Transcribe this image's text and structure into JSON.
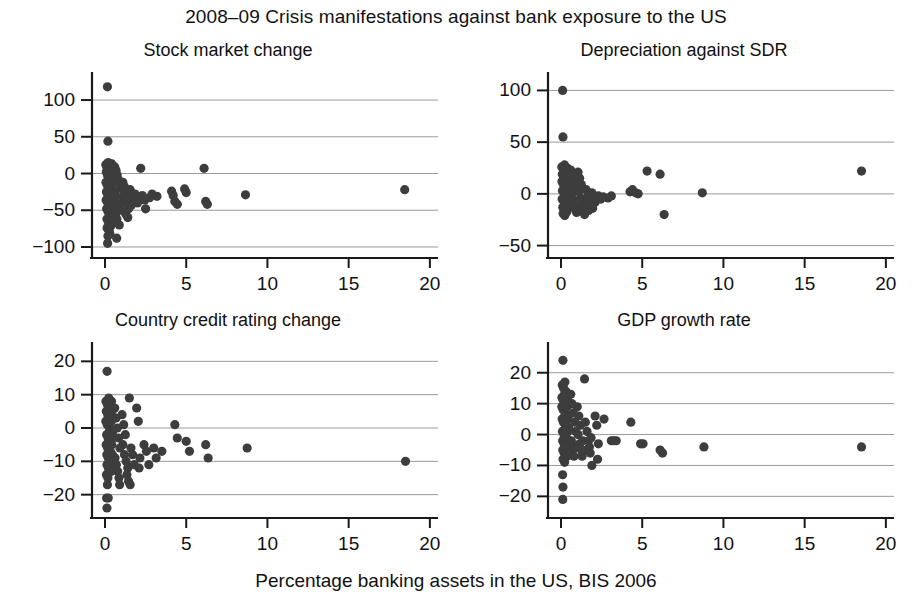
{
  "figure": {
    "title": "2008–09 Crisis manifestations against bank exposure to the US",
    "xlabel": "Percentage banking assets in the US, BIS 2006",
    "marker_color": "#3d3d3d",
    "gridline_color": "#9a9a9a",
    "axis_color": "#1a1a1a"
  },
  "chart_data": [
    {
      "type": "scatter",
      "title": "Stock market change",
      "xlabel": "Percentage banking assets in the US, BIS 2006",
      "ylabel": "",
      "xlim": [
        -0.8,
        20.5
      ],
      "ylim": [
        -115,
        130
      ],
      "xticks": [
        0,
        5,
        10,
        15,
        20
      ],
      "yticks": [
        100,
        50,
        0,
        -50,
        -100
      ],
      "grid": true,
      "legend": "none",
      "points": [
        [
          0.15,
          118
        ],
        [
          0.18,
          44
        ],
        [
          0.05,
          12
        ],
        [
          0.12,
          8
        ],
        [
          0.2,
          15
        ],
        [
          0.28,
          10
        ],
        [
          0.35,
          6
        ],
        [
          0.42,
          13
        ],
        [
          0.08,
          2
        ],
        [
          0.16,
          -3
        ],
        [
          0.24,
          -1
        ],
        [
          0.3,
          -6
        ],
        [
          0.38,
          -4
        ],
        [
          0.46,
          -9
        ],
        [
          0.06,
          -12
        ],
        [
          0.14,
          -16
        ],
        [
          0.22,
          -14
        ],
        [
          0.31,
          -19
        ],
        [
          0.4,
          -17
        ],
        [
          0.48,
          -22
        ],
        [
          0.09,
          -25
        ],
        [
          0.17,
          -28
        ],
        [
          0.26,
          -24
        ],
        [
          0.34,
          -31
        ],
        [
          0.43,
          -27
        ],
        [
          0.5,
          -33
        ],
        [
          0.07,
          -36
        ],
        [
          0.15,
          -39
        ],
        [
          0.23,
          -35
        ],
        [
          0.32,
          -42
        ],
        [
          0.41,
          -38
        ],
        [
          0.49,
          -45
        ],
        [
          0.1,
          -48
        ],
        [
          0.19,
          -52
        ],
        [
          0.27,
          -47
        ],
        [
          0.36,
          -55
        ],
        [
          0.44,
          -50
        ],
        [
          0.52,
          -58
        ],
        [
          0.12,
          -62
        ],
        [
          0.21,
          -66
        ],
        [
          0.29,
          -60
        ],
        [
          0.38,
          -70
        ],
        [
          0.47,
          -64
        ],
        [
          0.13,
          -74
        ],
        [
          0.25,
          -78
        ],
        [
          0.33,
          -72
        ],
        [
          0.18,
          -85
        ],
        [
          0.3,
          -82
        ],
        [
          0.16,
          -95
        ],
        [
          0.6,
          9
        ],
        [
          0.68,
          4
        ],
        [
          0.75,
          -2
        ],
        [
          0.82,
          -8
        ],
        [
          0.9,
          -14
        ],
        [
          0.98,
          -20
        ],
        [
          0.62,
          -26
        ],
        [
          0.7,
          -32
        ],
        [
          0.78,
          -38
        ],
        [
          0.86,
          -44
        ],
        [
          0.94,
          -50
        ],
        [
          0.65,
          -56
        ],
        [
          0.73,
          -62
        ],
        [
          0.88,
          -70
        ],
        [
          0.72,
          -88
        ],
        [
          1.1,
          -12
        ],
        [
          1.2,
          -18
        ],
        [
          1.3,
          -24
        ],
        [
          1.15,
          -30
        ],
        [
          1.25,
          -36
        ],
        [
          1.35,
          -42
        ],
        [
          1.45,
          -48
        ],
        [
          1.28,
          -55
        ],
        [
          1.4,
          -60
        ],
        [
          1.55,
          -22
        ],
        [
          1.65,
          -30
        ],
        [
          1.7,
          -38
        ],
        [
          1.6,
          -44
        ],
        [
          1.85,
          -28
        ],
        [
          1.95,
          -34
        ],
        [
          2.0,
          -40
        ],
        [
          2.2,
          7
        ],
        [
          2.3,
          -30
        ],
        [
          2.45,
          -36
        ],
        [
          2.5,
          -48
        ],
        [
          2.75,
          -33
        ],
        [
          2.9,
          -28
        ],
        [
          3.2,
          -31
        ],
        [
          4.1,
          -24
        ],
        [
          4.2,
          -30
        ],
        [
          4.3,
          -38
        ],
        [
          4.45,
          -42
        ],
        [
          4.9,
          -21
        ],
        [
          5.0,
          -26
        ],
        [
          6.1,
          7
        ],
        [
          6.2,
          -38
        ],
        [
          6.3,
          -42
        ],
        [
          8.65,
          -29
        ],
        [
          18.45,
          -22
        ]
      ]
    },
    {
      "type": "scatter",
      "title": "Depreciation against SDR",
      "xlabel": "Percentage banking assets in the US, BIS 2006",
      "ylabel": "",
      "xlim": [
        -0.8,
        20.5
      ],
      "ylim": [
        -62,
        112
      ],
      "xticks": [
        0,
        5,
        10,
        15,
        20
      ],
      "yticks": [
        100,
        50,
        0,
        -50
      ],
      "grid": true,
      "legend": "none",
      "points": [
        [
          0.1,
          100
        ],
        [
          0.12,
          55
        ],
        [
          0.05,
          26
        ],
        [
          0.14,
          24
        ],
        [
          0.22,
          28
        ],
        [
          0.3,
          22
        ],
        [
          0.38,
          25
        ],
        [
          0.08,
          19
        ],
        [
          0.17,
          16
        ],
        [
          0.25,
          20
        ],
        [
          0.33,
          14
        ],
        [
          0.42,
          17
        ],
        [
          0.06,
          12
        ],
        [
          0.15,
          9
        ],
        [
          0.24,
          11
        ],
        [
          0.32,
          7
        ],
        [
          0.4,
          10
        ],
        [
          0.48,
          5
        ],
        [
          0.09,
          3
        ],
        [
          0.18,
          1
        ],
        [
          0.27,
          4
        ],
        [
          0.35,
          -1
        ],
        [
          0.44,
          2
        ],
        [
          0.52,
          -3
        ],
        [
          0.07,
          -5
        ],
        [
          0.16,
          -7
        ],
        [
          0.26,
          -4
        ],
        [
          0.34,
          -9
        ],
        [
          0.43,
          -6
        ],
        [
          0.5,
          -11
        ],
        [
          0.11,
          -13
        ],
        [
          0.2,
          -15
        ],
        [
          0.29,
          -12
        ],
        [
          0.37,
          -17
        ],
        [
          0.46,
          -14
        ],
        [
          0.13,
          -19
        ],
        [
          0.23,
          -21
        ],
        [
          0.31,
          -18
        ],
        [
          0.6,
          23
        ],
        [
          0.68,
          18
        ],
        [
          0.76,
          13
        ],
        [
          0.84,
          8
        ],
        [
          0.92,
          3
        ],
        [
          0.64,
          -2
        ],
        [
          0.72,
          -6
        ],
        [
          0.8,
          -10
        ],
        [
          0.88,
          -14
        ],
        [
          0.96,
          -18
        ],
        [
          1.05,
          21
        ],
        [
          1.15,
          15
        ],
        [
          1.25,
          9
        ],
        [
          1.1,
          2
        ],
        [
          1.2,
          -4
        ],
        [
          1.3,
          -9
        ],
        [
          1.4,
          -13
        ],
        [
          1.35,
          -17
        ],
        [
          1.45,
          -20
        ],
        [
          1.55,
          4
        ],
        [
          1.65,
          -2
        ],
        [
          1.75,
          -7
        ],
        [
          1.6,
          -12
        ],
        [
          1.7,
          -16
        ],
        [
          1.9,
          1
        ],
        [
          2.0,
          -3
        ],
        [
          2.1,
          -8
        ],
        [
          1.95,
          -14
        ],
        [
          2.3,
          -2
        ],
        [
          2.45,
          -5
        ],
        [
          2.6,
          -3
        ],
        [
          2.9,
          -4
        ],
        [
          3.1,
          -2
        ],
        [
          4.25,
          2
        ],
        [
          4.4,
          4
        ],
        [
          4.6,
          1
        ],
        [
          4.75,
          0
        ],
        [
          5.3,
          22
        ],
        [
          6.1,
          19
        ],
        [
          6.35,
          -20
        ],
        [
          8.7,
          1
        ],
        [
          18.5,
          22
        ]
      ]
    },
    {
      "type": "scatter",
      "title": "Country credit rating change",
      "xlabel": "Percentage banking assets in the US, BIS 2006",
      "ylabel": "",
      "xlim": [
        -0.8,
        20.5
      ],
      "ylim": [
        -27,
        24
      ],
      "xticks": [
        0,
        5,
        10,
        15,
        20
      ],
      "yticks": [
        20,
        10,
        0,
        -10,
        -20
      ],
      "grid": true,
      "legend": "none",
      "points": [
        [
          0.13,
          17
        ],
        [
          0.06,
          8
        ],
        [
          0.15,
          7
        ],
        [
          0.23,
          9
        ],
        [
          0.31,
          6
        ],
        [
          0.4,
          8
        ],
        [
          0.08,
          5
        ],
        [
          0.17,
          4
        ],
        [
          0.26,
          6
        ],
        [
          0.34,
          3
        ],
        [
          0.43,
          5
        ],
        [
          0.05,
          2
        ],
        [
          0.14,
          1
        ],
        [
          0.22,
          3
        ],
        [
          0.3,
          0
        ],
        [
          0.39,
          2
        ],
        [
          0.47,
          -1
        ],
        [
          0.1,
          -2
        ],
        [
          0.19,
          -3
        ],
        [
          0.28,
          -1
        ],
        [
          0.36,
          -4
        ],
        [
          0.45,
          -2
        ],
        [
          0.07,
          -5
        ],
        [
          0.16,
          -6
        ],
        [
          0.25,
          -4
        ],
        [
          0.33,
          -7
        ],
        [
          0.42,
          -5
        ],
        [
          0.11,
          -8
        ],
        [
          0.2,
          -9
        ],
        [
          0.29,
          -7
        ],
        [
          0.38,
          -10
        ],
        [
          0.46,
          -8
        ],
        [
          0.12,
          -11
        ],
        [
          0.21,
          -12
        ],
        [
          0.3,
          -10
        ],
        [
          0.4,
          -13
        ],
        [
          0.09,
          -14
        ],
        [
          0.18,
          -15
        ],
        [
          0.27,
          -13
        ],
        [
          0.15,
          -17
        ],
        [
          0.1,
          -21
        ],
        [
          0.2,
          -21
        ],
        [
          0.12,
          -24
        ],
        [
          0.6,
          6
        ],
        [
          0.68,
          3
        ],
        [
          0.76,
          0
        ],
        [
          0.84,
          -3
        ],
        [
          0.92,
          -6
        ],
        [
          0.62,
          -9
        ],
        [
          0.7,
          -11
        ],
        [
          0.78,
          -13
        ],
        [
          0.86,
          -15
        ],
        [
          0.9,
          -17
        ],
        [
          1.05,
          4
        ],
        [
          1.15,
          1
        ],
        [
          1.25,
          -2
        ],
        [
          1.1,
          -5
        ],
        [
          1.2,
          -8
        ],
        [
          1.3,
          -10
        ],
        [
          1.4,
          -12
        ],
        [
          1.35,
          -14
        ],
        [
          1.45,
          -16
        ],
        [
          1.5,
          9
        ],
        [
          1.6,
          -6
        ],
        [
          1.7,
          -8
        ],
        [
          1.8,
          -11
        ],
        [
          1.55,
          -17
        ],
        [
          1.95,
          6
        ],
        [
          2.05,
          2
        ],
        [
          2.15,
          -9
        ],
        [
          2.1,
          -12
        ],
        [
          2.4,
          -5
        ],
        [
          2.55,
          -7
        ],
        [
          2.7,
          -11
        ],
        [
          3.0,
          -6
        ],
        [
          3.15,
          -9
        ],
        [
          3.5,
          -7
        ],
        [
          4.3,
          1
        ],
        [
          4.45,
          -3
        ],
        [
          5.0,
          -4
        ],
        [
          5.2,
          -7
        ],
        [
          6.2,
          -5
        ],
        [
          6.35,
          -9
        ],
        [
          8.75,
          -6
        ],
        [
          18.5,
          -10
        ]
      ]
    },
    {
      "type": "scatter",
      "title": "GDP growth rate",
      "xlabel": "Percentage banking assets in the US, BIS 2006",
      "ylabel": "",
      "xlim": [
        -0.8,
        20.5
      ],
      "ylim": [
        -27,
        28
      ],
      "xticks": [
        0,
        5,
        10,
        15,
        20
      ],
      "yticks": [
        20,
        10,
        0,
        -10,
        -20
      ],
      "grid": true,
      "legend": "none",
      "points": [
        [
          0.12,
          24
        ],
        [
          0.08,
          16
        ],
        [
          0.16,
          15
        ],
        [
          0.24,
          17
        ],
        [
          0.3,
          14
        ],
        [
          0.06,
          12
        ],
        [
          0.14,
          11
        ],
        [
          0.22,
          13
        ],
        [
          0.3,
          10
        ],
        [
          0.38,
          12
        ],
        [
          0.05,
          9
        ],
        [
          0.13,
          8
        ],
        [
          0.21,
          10
        ],
        [
          0.29,
          7
        ],
        [
          0.37,
          9
        ],
        [
          0.45,
          6
        ],
        [
          0.07,
          5
        ],
        [
          0.15,
          4
        ],
        [
          0.23,
          6
        ],
        [
          0.31,
          3
        ],
        [
          0.4,
          5
        ],
        [
          0.48,
          2
        ],
        [
          0.09,
          1
        ],
        [
          0.18,
          0
        ],
        [
          0.26,
          2
        ],
        [
          0.34,
          -1
        ],
        [
          0.43,
          1
        ],
        [
          0.1,
          -2
        ],
        [
          0.19,
          -3
        ],
        [
          0.28,
          -1
        ],
        [
          0.36,
          -4
        ],
        [
          0.44,
          -2
        ],
        [
          0.11,
          -5
        ],
        [
          0.2,
          -6
        ],
        [
          0.29,
          -4
        ],
        [
          0.38,
          -7
        ],
        [
          0.13,
          -8
        ],
        [
          0.22,
          -9
        ],
        [
          0.1,
          -13
        ],
        [
          0.12,
          -17
        ],
        [
          0.11,
          -21
        ],
        [
          0.6,
          13
        ],
        [
          0.68,
          10
        ],
        [
          0.76,
          7
        ],
        [
          0.84,
          4
        ],
        [
          0.92,
          1
        ],
        [
          0.64,
          -2
        ],
        [
          0.72,
          -5
        ],
        [
          0.8,
          -7
        ],
        [
          0.88,
          -4
        ],
        [
          1.0,
          9
        ],
        [
          1.1,
          6
        ],
        [
          1.2,
          3
        ],
        [
          1.05,
          0
        ],
        [
          1.15,
          -3
        ],
        [
          1.25,
          -5
        ],
        [
          1.35,
          -2
        ],
        [
          1.3,
          -7
        ],
        [
          1.45,
          18
        ],
        [
          1.5,
          4
        ],
        [
          1.6,
          1
        ],
        [
          1.7,
          -2
        ],
        [
          1.55,
          -5
        ],
        [
          1.75,
          -4
        ],
        [
          1.85,
          -1
        ],
        [
          1.8,
          -6
        ],
        [
          1.9,
          -10
        ],
        [
          2.1,
          6
        ],
        [
          2.2,
          3
        ],
        [
          2.3,
          -3
        ],
        [
          2.25,
          -8
        ],
        [
          2.65,
          5
        ],
        [
          3.1,
          -2
        ],
        [
          3.25,
          -2
        ],
        [
          3.4,
          -2
        ],
        [
          4.3,
          4
        ],
        [
          4.9,
          -3
        ],
        [
          5.05,
          -3
        ],
        [
          6.1,
          -5
        ],
        [
          6.25,
          -6
        ],
        [
          8.8,
          -4
        ],
        [
          18.5,
          -4
        ]
      ]
    }
  ]
}
